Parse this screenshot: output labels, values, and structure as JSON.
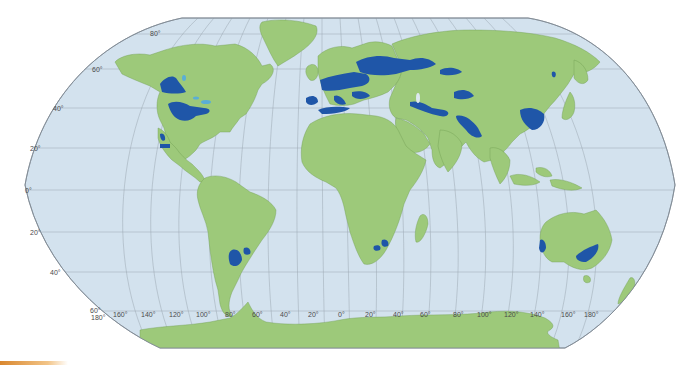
{
  "map": {
    "projection": "Robinson",
    "colors": {
      "ocean": "#d3e2ee",
      "land": "#9dc97a",
      "highlight": "#1f56a8",
      "lakes": "#5aaed6",
      "graticule": "#8e9aa6",
      "outline": "#7d8892",
      "borders": "#3c5a2a"
    },
    "latitude_labels_left": [
      "80°",
      "60°",
      "40°",
      "20°",
      "0°",
      "20°",
      "40°",
      "60°"
    ],
    "longitude_labels_bottom": [
      "180°",
      "160°",
      "140°",
      "120°",
      "100°",
      "80°",
      "60°",
      "40°",
      "20°",
      "0°",
      "20°",
      "40°",
      "60°",
      "80°",
      "100°",
      "120°",
      "140°",
      "160°",
      "180°"
    ],
    "highlighted_regions": [
      "Canadian Prairies",
      "US Midwest / Great Plains",
      "Mexico Central Plateau",
      "Pampas (Argentina/Uruguay)",
      "Western & Central Europe",
      "Eastern Europe / Western Russia",
      "Kazakh Steppe",
      "North Africa (Maghreb coast)",
      "Middle East / Anatolia",
      "Indo-Gangetic Plain",
      "North China Plain",
      "Northeast China",
      "South Africa (Highveld)",
      "Southwest Australia",
      "Southeast Australia (Murray-Darling)"
    ]
  },
  "accent_bar": {
    "color_start": "#d9872e",
    "color_end": "#f2c487"
  }
}
